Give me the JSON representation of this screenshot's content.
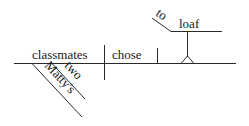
{
  "diagram": {
    "type": "sentence-diagram",
    "subject": "classmates",
    "verb": "chose",
    "direct_object": {
      "infinitive_marker": "to",
      "verb": "loaf"
    },
    "modifiers": [
      {
        "word": "two",
        "modifies": "classmates"
      },
      {
        "word": "Matty's",
        "modifies": "classmates"
      }
    ]
  }
}
